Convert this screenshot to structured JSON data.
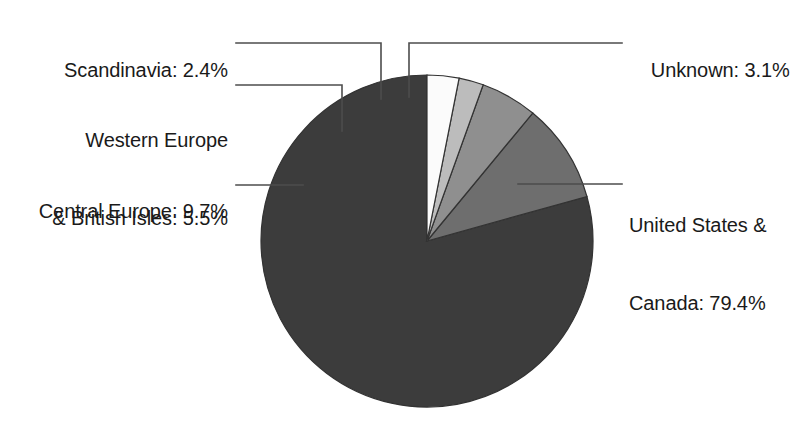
{
  "figure": {
    "background_color": "#ffffff",
    "text_color": "#1a1a1a",
    "leader_line_color": "#4d4d4d",
    "slice_border_color": "#333333"
  },
  "chart_data": {
    "type": "pie",
    "title": "",
    "subtitle": "",
    "xlabel": "",
    "ylabel": "",
    "grid": false,
    "legend": "none",
    "legend_position": "callout-labels",
    "value_unit": "percent",
    "start_angle_deg": 90,
    "direction": "counterclockwise",
    "categories": [
      "United States & Canada",
      "Central Europe",
      "Western Europe & British Isles",
      "Scandinavia",
      "Unknown"
    ],
    "values": [
      79.4,
      9.7,
      5.5,
      2.4,
      3.1
    ],
    "colors": [
      "#3c3c3c",
      "#6e6e6e",
      "#8f8f8f",
      "#bcbcbc",
      "#fbfbfb"
    ],
    "labels": [
      "United States &\nCanada: 79.4%",
      "Central Europe: 9.7%",
      "Western Europe\n& British Isles: 5.5%",
      "Scandinavia: 2.4%",
      "Unknown: 3.1%"
    ],
    "slices": [
      {
        "name": "United States & Canada",
        "value": 79.4,
        "color": "#3c3c3c"
      },
      {
        "name": "Central Europe",
        "value": 9.7,
        "color": "#6e6e6e"
      },
      {
        "name": "Western Europe & British Isles",
        "value": 5.5,
        "color": "#8f8f8f"
      },
      {
        "name": "Scandinavia",
        "value": 2.4,
        "color": "#bcbcbc"
      },
      {
        "name": "Unknown",
        "value": 3.1,
        "color": "#fbfbfb"
      }
    ]
  },
  "labels": {
    "scandinavia": "Scandinavia: 2.4%",
    "western_europe_line1": "Western Europe",
    "western_europe_line2": "& British Isles: 5.5%",
    "central_europe": "Central Europe: 9.7%",
    "unknown": "Unknown: 3.1%",
    "us_canada_line1": "United States &",
    "us_canada_line2": "Canada: 79.4%"
  }
}
